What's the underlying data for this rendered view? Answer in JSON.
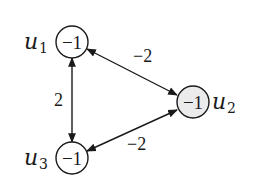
{
  "diagram": {
    "type": "weighted-graph",
    "nodes": [
      {
        "id": "u1",
        "name": "u",
        "sub": "1",
        "value": "−1",
        "shaded": false
      },
      {
        "id": "u2",
        "name": "u",
        "sub": "2",
        "value": "−1",
        "shaded": true
      },
      {
        "id": "u3",
        "name": "u",
        "sub": "3",
        "value": "−1",
        "shaded": false
      }
    ],
    "edges": [
      {
        "from": "u1",
        "to": "u2",
        "weight": "−2",
        "bidirectional": true
      },
      {
        "from": "u1",
        "to": "u3",
        "weight": "2",
        "bidirectional": true
      },
      {
        "from": "u3",
        "to": "u2",
        "weight": "−2",
        "bidirectional": true
      }
    ],
    "colors": {
      "stroke": "#1a1a1a",
      "shaded_fill": "#ebebeb",
      "fill": "#ffffff"
    }
  }
}
